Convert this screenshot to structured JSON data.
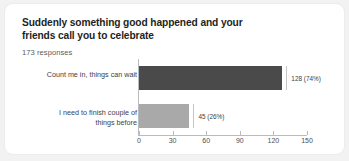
{
  "card": {
    "title": "Suddenly something good happened and your friends call you to celebrate",
    "responses": "173 responses",
    "background": "#ffffff",
    "page_background": "#f2f2f3"
  },
  "chart_data": {
    "type": "bar",
    "orientation": "horizontal",
    "title": "Suddenly something good happened and your friends call you to celebrate",
    "subtitle": "173 responses",
    "categories": [
      "Count me in, things can wait",
      "I need to finish couple of things before"
    ],
    "values": [
      128,
      45
    ],
    "percentages": [
      "74%",
      "26%"
    ],
    "data_labels": [
      "128 (74%)",
      "45 (26%)"
    ],
    "colors": [
      "#4a4a4a",
      "#a9a9a9"
    ],
    "xlabel": "",
    "ylabel": "",
    "xlim": [
      0,
      150
    ],
    "xticks": [
      0,
      30,
      60,
      90,
      120,
      150
    ],
    "xtick_labels": [
      "0",
      "30",
      "60",
      "90",
      "120",
      "150"
    ],
    "grid": false,
    "legend": false,
    "total_responses": 173
  }
}
